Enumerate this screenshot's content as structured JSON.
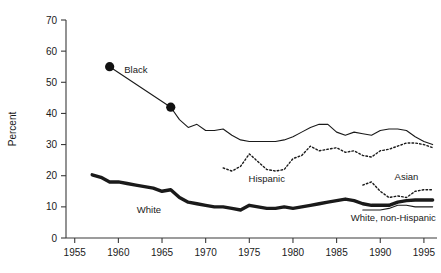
{
  "chart_data": {
    "type": "line",
    "title": "",
    "xlabel": "",
    "ylabel": "Percent",
    "xlim": [
      1954,
      1996.5
    ],
    "ylim": [
      0,
      70
    ],
    "grid": false,
    "legend_position": "inline-annotations",
    "y_ticks": [
      "0",
      "10",
      "20",
      "30",
      "40",
      "50",
      "60",
      "70"
    ],
    "x_ticks": [
      "1955",
      "1960",
      "1965",
      "1970",
      "1975",
      "1980",
      "1985",
      "1990",
      "1995"
    ],
    "series": [
      {
        "name": "Black",
        "style": "solid-thin",
        "label": "Black",
        "label_x": 1962.0,
        "label_y": 53.0,
        "markers": [
          {
            "x": 1959,
            "y": 55.0
          },
          {
            "x": 1966,
            "y": 42.0
          }
        ],
        "x": [
          1959,
          1966,
          1967,
          1968,
          1969,
          1970,
          1971,
          1972,
          1973,
          1974,
          1975,
          1976,
          1977,
          1978,
          1979,
          1980,
          1981,
          1982,
          1983,
          1984,
          1985,
          1986,
          1987,
          1988,
          1989,
          1990,
          1991,
          1992,
          1993,
          1994,
          1995,
          1996
        ],
        "values": [
          55.0,
          42.0,
          38.0,
          35.5,
          36.5,
          34.5,
          34.5,
          35.0,
          33.0,
          31.5,
          31.0,
          31.0,
          31.0,
          31.0,
          31.5,
          32.5,
          34.0,
          35.5,
          36.5,
          36.5,
          34.0,
          33.0,
          34.0,
          33.5,
          33.0,
          34.5,
          35.0,
          35.0,
          34.5,
          32.5,
          31.0,
          30.0
        ]
      },
      {
        "name": "Hispanic",
        "style": "dotted",
        "label": "Hispanic",
        "label_x": 1977.0,
        "label_y": 18.0,
        "x": [
          1972,
          1973,
          1974,
          1975,
          1976,
          1977,
          1978,
          1979,
          1980,
          1981,
          1982,
          1983,
          1984,
          1985,
          1986,
          1987,
          1988,
          1989,
          1990,
          1991,
          1992,
          1993,
          1994,
          1995,
          1996
        ],
        "values": [
          22.5,
          21.5,
          23.0,
          27.0,
          24.5,
          22.0,
          21.5,
          22.0,
          25.5,
          26.5,
          29.5,
          28.0,
          28.5,
          29.0,
          27.5,
          28.0,
          26.5,
          26.0,
          28.0,
          28.5,
          29.5,
          30.5,
          30.5,
          30.0,
          29.0
        ]
      },
      {
        "name": "White",
        "style": "solid-thick",
        "label": "White",
        "label_x": 1963.5,
        "label_y": 8.0,
        "x": [
          1957,
          1958,
          1959,
          1960,
          1961,
          1962,
          1963,
          1964,
          1965,
          1966,
          1967,
          1968,
          1969,
          1970,
          1971,
          1972,
          1973,
          1974,
          1975,
          1976,
          1977,
          1978,
          1979,
          1980,
          1981,
          1982,
          1983,
          1984,
          1985,
          1986,
          1987,
          1988,
          1989,
          1990,
          1991,
          1992,
          1993,
          1994,
          1995,
          1996
        ],
        "values": [
          20.3,
          19.5,
          18.0,
          18.0,
          17.5,
          17.0,
          16.5,
          16.0,
          15.0,
          15.5,
          13.0,
          11.5,
          11.0,
          10.5,
          10.0,
          10.0,
          9.5,
          9.0,
          10.5,
          10.0,
          9.5,
          9.5,
          10.0,
          9.5,
          10.0,
          10.5,
          11.0,
          11.5,
          12.0,
          12.5,
          12.0,
          11.0,
          10.5,
          10.5,
          10.5,
          11.5,
          12.0,
          12.2,
          12.2,
          12.2
        ]
      },
      {
        "name": "Asian",
        "style": "dotted",
        "label": "Asian",
        "label_x": 1993.0,
        "label_y": 18.5,
        "x": [
          1988,
          1989,
          1990,
          1991,
          1992,
          1993,
          1994,
          1995,
          1996
        ],
        "values": [
          17.0,
          18.0,
          15.0,
          13.0,
          13.5,
          13.0,
          15.0,
          15.5,
          15.5
        ]
      },
      {
        "name": "White, non-Hispanic",
        "style": "solid-thin",
        "label": "White, non-Hispanic",
        "label_x": 1991.5,
        "label_y": 5.5,
        "x": [
          1988,
          1989,
          1990,
          1991,
          1992,
          1993,
          1994,
          1995,
          1996
        ],
        "values": [
          9.0,
          9.0,
          9.0,
          9.5,
          10.5,
          10.5,
          10.0,
          10.0,
          10.0
        ]
      }
    ]
  }
}
